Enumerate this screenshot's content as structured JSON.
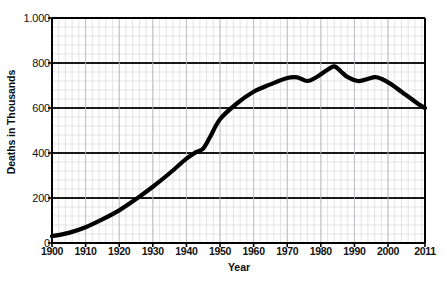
{
  "chart_data": {
    "type": "line",
    "title": "",
    "xlabel": "Year",
    "ylabel": "Deaths in Thousands",
    "xlim": [
      1900,
      2011
    ],
    "ylim": [
      0,
      1000
    ],
    "grid": true,
    "legend": false,
    "legend_position": "none",
    "x_tick_labels": [
      "1900",
      "1910",
      "1920",
      "1930",
      "1940",
      "1950",
      "1960",
      "1970",
      "1980",
      "1990",
      "2000",
      "2011"
    ],
    "x_tick_values": [
      1900,
      1910,
      1920,
      1930,
      1940,
      1950,
      1960,
      1970,
      1980,
      1990,
      2000,
      2011
    ],
    "y_tick_labels": [
      "0",
      "200",
      "400",
      "600",
      "800",
      "1.000"
    ],
    "y_tick_values": [
      0,
      200,
      400,
      600,
      800,
      1000
    ],
    "y_minor_step": 40,
    "x_minor_step": 2,
    "line_color": "#000000",
    "line_width": 4.2,
    "grid_color_major": "#1a1a1a",
    "grid_color_minor": "#d8d8dd",
    "axis_color": "#000000",
    "background_color": "#ffffff",
    "series": [
      {
        "name": "Deaths",
        "x": [
          1900,
          1905,
          1910,
          1915,
          1920,
          1925,
          1930,
          1935,
          1940,
          1943,
          1945,
          1947,
          1950,
          1955,
          1960,
          1965,
          1970,
          1973,
          1976,
          1979,
          1982,
          1984,
          1986,
          1988,
          1991,
          1993,
          1996,
          1998,
          2001,
          2004,
          2007,
          2009,
          2011
        ],
        "values": [
          30,
          45,
          70,
          105,
          145,
          195,
          250,
          310,
          375,
          405,
          420,
          470,
          550,
          620,
          672,
          705,
          733,
          736,
          720,
          740,
          770,
          785,
          762,
          737,
          720,
          725,
          737,
          730,
          705,
          672,
          640,
          618,
          600
        ]
      }
    ]
  }
}
